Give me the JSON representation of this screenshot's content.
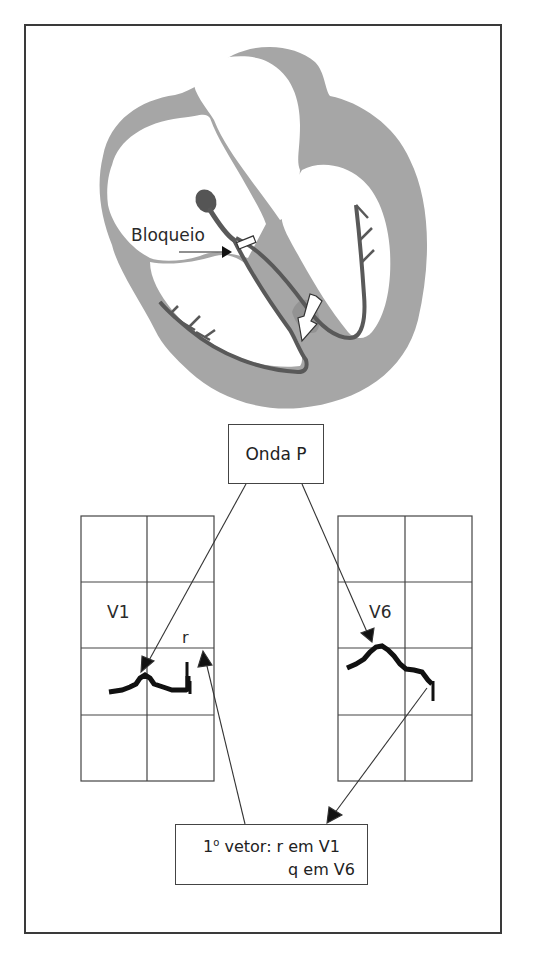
{
  "figure": {
    "type": "heart-conduction-ecg-diagram",
    "heart": {
      "block_label": "Bloqueio",
      "colors": {
        "myocardium": "#a6a6a6",
        "conduction_system": "#5a5a5a",
        "node": "#555555",
        "chamber": "#ffffff"
      }
    },
    "onda_box": {
      "label": "Onda P"
    },
    "leads": [
      {
        "name": "V1",
        "wave_label": "r"
      },
      {
        "name": "V6",
        "wave_label": ""
      }
    ],
    "vector_box": {
      "line1_prefix": "1",
      "line1_sup": "o",
      "line1_rest": " vetor: r em V1",
      "line2": "q em V6"
    },
    "colors": {
      "frame": "#3a3a3a",
      "grid": "#444444",
      "trace": "#111111"
    }
  }
}
